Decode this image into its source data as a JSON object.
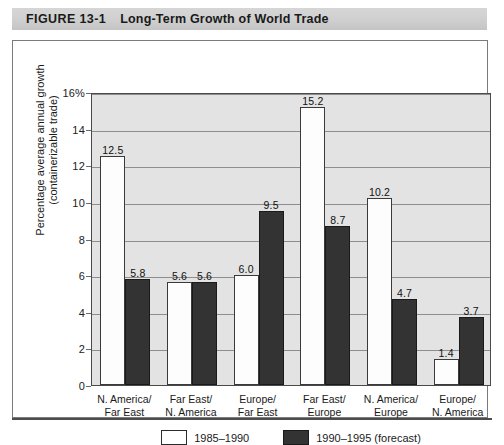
{
  "figure": {
    "number_label": "FIGURE 13-1",
    "title": "Long-Term Growth of World Trade"
  },
  "chart_data": {
    "type": "bar",
    "title": "Long-Term Growth of World Trade",
    "xlabel": "",
    "ylabel": "Percentage average annual growth (containerizable trade)",
    "ylabel_line1": "Percentage average annual growth",
    "ylabel_line2": "(containerizable trade)",
    "ylim": [
      0,
      16
    ],
    "yticks": [
      0,
      2,
      4,
      6,
      8,
      10,
      12,
      14,
      16
    ],
    "ytick_labels": [
      "0",
      "2",
      "4",
      "6",
      "8",
      "10",
      "12",
      "14",
      "16%"
    ],
    "grid": true,
    "legend_position": "bottom",
    "categories": [
      "N. America/\nFar East",
      "Far East/\nN. America",
      "Europe/\nFar East",
      "Far East/\nEurope",
      "N. America/\nEurope",
      "Europe/\nN. America"
    ],
    "category_lines": [
      [
        "N. America/",
        "Far East"
      ],
      [
        "Far East/",
        "N. America"
      ],
      [
        "Europe/",
        "Far East"
      ],
      [
        "Far East/",
        "Europe"
      ],
      [
        "N. America/",
        "Europe"
      ],
      [
        "Europe/",
        "N. America"
      ]
    ],
    "series": [
      {
        "name": "1985–1990",
        "color": "#ffffff",
        "values": [
          12.5,
          5.6,
          6.0,
          15.2,
          10.2,
          1.4
        ],
        "value_labels": [
          "12.5",
          "5.6",
          "6.0",
          "15.2",
          "10.2",
          "1.4"
        ]
      },
      {
        "name": "1990–1995 (forecast)",
        "color": "#333333",
        "values": [
          5.8,
          5.6,
          9.5,
          8.7,
          4.7,
          3.7
        ],
        "value_labels": [
          "5.8",
          "5.6",
          "9.5",
          "8.7",
          "4.7",
          "3.7"
        ]
      }
    ]
  },
  "legend": {
    "items": [
      {
        "label": "1985–1990",
        "swatch": "light"
      },
      {
        "label": "1990–1995 (forecast)",
        "swatch": "dark"
      }
    ]
  }
}
